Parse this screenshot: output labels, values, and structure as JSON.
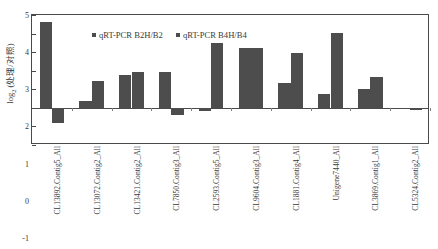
{
  "chart_data": {
    "type": "bar",
    "title": "",
    "xlabel": "",
    "ylabel": "log2 (处理/对照)",
    "ylabel_base": "log",
    "ylabel_sub": "2",
    "ylabel_rest": " (处理/对照)",
    "ylim": [
      -2,
      5
    ],
    "yticks": [
      -2,
      -1,
      0,
      1,
      2,
      3,
      4,
      5
    ],
    "ytick_labels": [
      "-2",
      "-1",
      "0",
      "1",
      "2",
      "3",
      "4",
      "5"
    ],
    "grid": false,
    "legend_position": "top-left-inside",
    "categories": [
      "CL13892.Contig5_All",
      "CL13072.Contig2_All",
      "CL13421.Contig2_All",
      "CL7850.Contig3_All",
      "CL2593.Contig5_All",
      "CL9604.Contig3_All",
      "CL1881.Contig4_All",
      "Unigene7440_All",
      "CL3869.Contig1_All",
      "CL5324.Contig2_All"
    ],
    "series": [
      {
        "name": "qRT-PCR B2H/B2",
        "color": "#4d4d4d",
        "values": [
          4.62,
          0.35,
          1.77,
          1.91,
          -0.18,
          3.25,
          1.32,
          0.76,
          1.0,
          -0.08
        ]
      },
      {
        "name": "qRT-PCR B4H/B4",
        "color": "#4d4d4d",
        "values": [
          -0.82,
          1.42,
          1.93,
          -0.37,
          3.48,
          3.25,
          2.98,
          4.03,
          1.68,
          -0.1
        ]
      }
    ]
  }
}
